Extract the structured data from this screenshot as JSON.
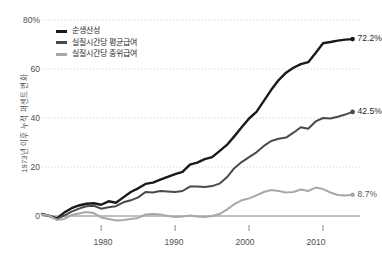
{
  "chart_data": {
    "type": "line",
    "title": "",
    "subtitle": "",
    "xlabel": "",
    "ylabel": "1973년 이후 누적 퍼센트 변화",
    "xlim": [
      1972,
      2015
    ],
    "ylim": [
      0,
      80
    ],
    "grid": true,
    "grid_style": "dotted-horizontal",
    "legend_position": "top-left",
    "y_ticks": [
      "80%",
      "60",
      "40",
      "20",
      "0"
    ],
    "y_tick_values": [
      80,
      60,
      40,
      20,
      0
    ],
    "x_ticks": [
      "1980",
      "1990",
      "2000",
      "2010"
    ],
    "x_tick_values": [
      1980,
      1990,
      2000,
      2010
    ],
    "x": [
      1972,
      1973,
      1974,
      1975,
      1976,
      1977,
      1978,
      1979,
      1980,
      1981,
      1982,
      1983,
      1984,
      1985,
      1986,
      1987,
      1988,
      1989,
      1990,
      1991,
      1992,
      1993,
      1994,
      1995,
      1996,
      1997,
      1998,
      1999,
      2000,
      2001,
      2002,
      2003,
      2004,
      2005,
      2006,
      2007,
      2008,
      2009,
      2010,
      2011,
      2012,
      2013,
      2014
    ],
    "series": [
      {
        "name": "순생산성",
        "color": "#1a1a1a",
        "end_label": "72.2%",
        "end_value": 72.2,
        "values": [
          0.8,
          0.0,
          -1.0,
          1.4,
          3.2,
          4.3,
          5.0,
          5.2,
          4.6,
          6.0,
          5.4,
          7.6,
          9.8,
          11.3,
          13.1,
          13.6,
          14.8,
          16.0,
          17.1,
          18.0,
          21.0,
          21.8,
          23.2,
          24.0,
          26.5,
          29.0,
          32.5,
          36.2,
          39.8,
          42.5,
          47.0,
          51.5,
          55.5,
          58.5,
          60.5,
          62.0,
          62.8,
          66.5,
          70.5,
          71.0,
          71.6,
          72.0,
          72.2
        ]
      },
      {
        "name": "실질시간당 평균급여",
        "color": "#4a4a4a",
        "end_label": "42.5%",
        "end_value": 42.5,
        "values": [
          0.9,
          0.0,
          -1.2,
          0.2,
          1.8,
          3.0,
          4.0,
          4.2,
          3.0,
          3.6,
          4.0,
          5.6,
          6.4,
          7.6,
          9.8,
          9.6,
          10.2,
          10.0,
          9.8,
          10.2,
          12.0,
          12.0,
          11.8,
          12.2,
          13.2,
          15.8,
          19.5,
          22.0,
          24.0,
          26.0,
          28.6,
          30.6,
          31.5,
          32.0,
          34.0,
          36.2,
          35.6,
          38.6,
          40.0,
          39.8,
          40.5,
          41.4,
          42.5
        ]
      },
      {
        "name": "실질시간당 중위급여",
        "color": "#a8a8a8",
        "end_label": "8.7%",
        "end_value": 8.7,
        "values": [
          0.6,
          0.0,
          -1.6,
          -1.2,
          0.4,
          1.0,
          1.6,
          1.2,
          -0.6,
          -1.2,
          -1.8,
          -1.6,
          -1.2,
          -0.8,
          0.6,
          0.8,
          0.6,
          0.0,
          -0.4,
          -0.2,
          0.2,
          -0.2,
          -0.4,
          0.0,
          0.8,
          2.6,
          4.8,
          6.4,
          7.2,
          8.4,
          9.8,
          10.6,
          10.2,
          9.6,
          9.8,
          10.8,
          10.2,
          11.6,
          11.0,
          9.6,
          8.6,
          8.4,
          8.7
        ]
      }
    ]
  },
  "legend": {
    "items": [
      {
        "label": "순생산성"
      },
      {
        "label": "실질시간당 평균급여"
      },
      {
        "label": "실질시간당 중위급여"
      }
    ]
  }
}
